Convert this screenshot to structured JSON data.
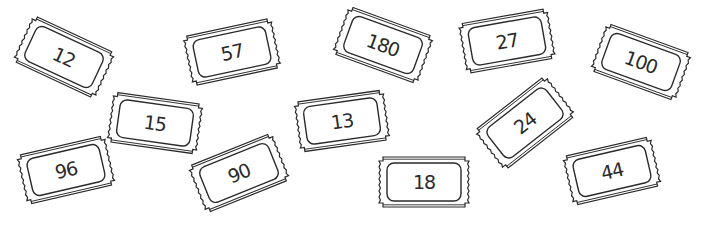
{
  "tickets": [
    {
      "label": "12"
    },
    {
      "label": "57"
    },
    {
      "label": "180"
    },
    {
      "label": "27"
    },
    {
      "label": "100"
    },
    {
      "label": "15"
    },
    {
      "label": "13"
    },
    {
      "label": "24"
    },
    {
      "label": "96"
    },
    {
      "label": "90"
    },
    {
      "label": "18"
    },
    {
      "label": "44"
    }
  ],
  "colors": {
    "line": "#2a2a2a",
    "background": "#ffffff"
  }
}
